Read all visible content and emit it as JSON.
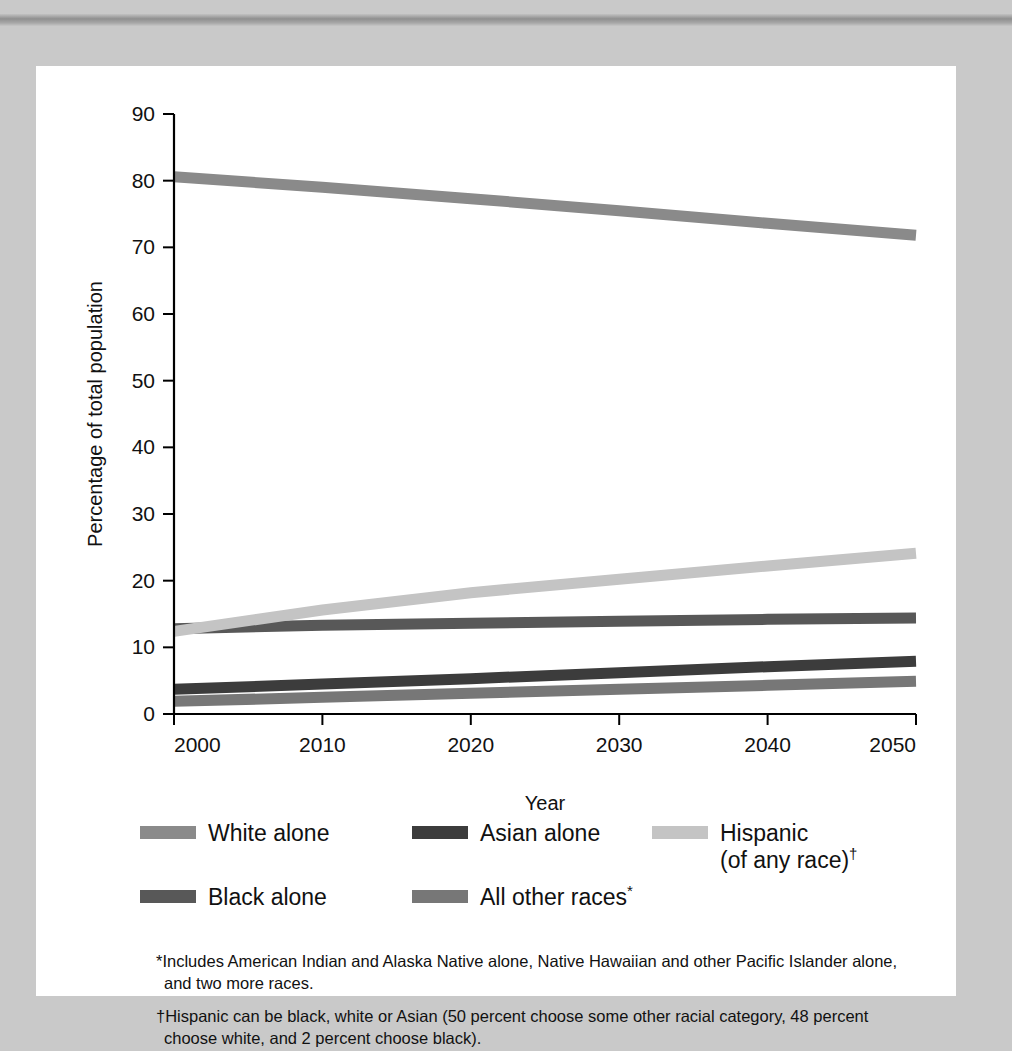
{
  "figure": {
    "background_color": "#c9c9c9",
    "panel_color": "#ffffff"
  },
  "chart_data": {
    "type": "line",
    "title": "",
    "xlabel": "Year",
    "ylabel": "Percentage of total population",
    "x": [
      2000,
      2010,
      2020,
      2030,
      2040,
      2050
    ],
    "xlim": [
      2000,
      2050
    ],
    "ylim": [
      0,
      90
    ],
    "xticks": [
      "2000",
      "2010",
      "2020",
      "2030",
      "2040",
      "2050"
    ],
    "yticks": [
      "0",
      "10",
      "20",
      "30",
      "40",
      "50",
      "60",
      "70",
      "80",
      "90"
    ],
    "grid": false,
    "legend_position": "below-axes",
    "series": [
      {
        "name": "White alone",
        "color": "#8a8a8a",
        "values": [
          80.6,
          79.0,
          77.3,
          75.5,
          73.6,
          71.8
        ]
      },
      {
        "name": "Black alone",
        "color": "#585858",
        "values": [
          12.8,
          13.3,
          13.6,
          13.9,
          14.2,
          14.4
        ]
      },
      {
        "name": "Asian alone",
        "color": "#3c3c3c",
        "values": [
          3.7,
          4.5,
          5.3,
          6.2,
          7.1,
          7.9
        ]
      },
      {
        "name": "All other races*",
        "color": "#777777",
        "values": [
          1.9,
          2.5,
          3.1,
          3.7,
          4.3,
          4.9
        ]
      },
      {
        "name": "Hispanic (of any race)†",
        "color": "#c4c4c4",
        "values": [
          12.4,
          15.6,
          18.2,
          20.2,
          22.2,
          24.1
        ]
      }
    ]
  },
  "legend": {
    "items": [
      {
        "label": "White alone",
        "color": "#8a8a8a",
        "marker": ""
      },
      {
        "label": "Asian alone",
        "color": "#3c3c3c",
        "marker": ""
      },
      {
        "label": "Hispanic\n(of any race)",
        "color": "#c4c4c4",
        "marker": "†"
      },
      {
        "label": "Black alone",
        "color": "#585858",
        "marker": ""
      },
      {
        "label": "All other races",
        "color": "#777777",
        "marker": "*"
      }
    ]
  },
  "footnotes": [
    {
      "marker": "*",
      "text": "Includes American Indian and Alaska Native alone, Native Hawaiian and other Pacific Islander alone, and two more races."
    },
    {
      "marker": "†",
      "text": "Hispanic can be black, white or Asian (50 percent choose some other racial category, 48 percent choose white, and 2 percent choose black)."
    }
  ]
}
